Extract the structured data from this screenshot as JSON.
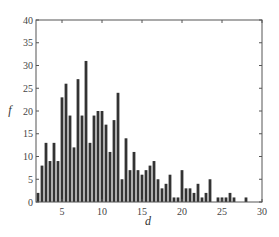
{
  "chart_data": {
    "type": "bar",
    "title": "",
    "xlabel": "d",
    "ylabel": "f",
    "xlim": [
      1.75,
      30
    ],
    "ylim": [
      0,
      40
    ],
    "xticks": [
      5,
      10,
      15,
      20,
      25,
      30
    ],
    "yticks": [
      0,
      5,
      10,
      15,
      20,
      25,
      30,
      35,
      40
    ],
    "grid": false,
    "legend": null,
    "bar_width": 0.5,
    "bar_color": "#333333",
    "x": [
      2,
      2.5,
      3,
      3.5,
      4,
      4.5,
      5,
      5.5,
      6,
      6.5,
      7,
      7.5,
      8,
      8.5,
      9,
      9.5,
      10,
      10.5,
      11,
      11.5,
      12,
      12.5,
      13,
      13.5,
      14,
      14.5,
      15,
      15.5,
      16,
      16.5,
      17,
      17.5,
      18,
      18.5,
      19,
      19.5,
      20,
      20.5,
      21,
      21.5,
      22,
      22.5,
      23,
      23.5,
      24,
      24.5,
      25,
      25.5,
      26,
      26.5,
      27,
      27.5,
      28,
      28.5,
      29,
      29.5
    ],
    "values": [
      2,
      8,
      13,
      9,
      13,
      9,
      23,
      26,
      19,
      12,
      27,
      19,
      31,
      13,
      19,
      20,
      20,
      17,
      11,
      18,
      24,
      5,
      14,
      7,
      11,
      7,
      6,
      7,
      8,
      9,
      5,
      3,
      4,
      6,
      1,
      1,
      7,
      3,
      3,
      2,
      4,
      1,
      2,
      5,
      0,
      1,
      1,
      1,
      2,
      1,
      0,
      0,
      1,
      0,
      0,
      0
    ]
  }
}
